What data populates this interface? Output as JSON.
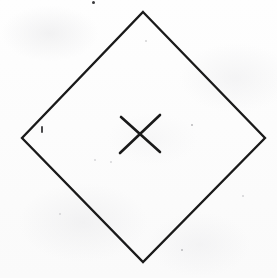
{
  "image": {
    "title": "Hand-drawn diamond with X mark",
    "description": "A scanned line drawing on off-white paper showing a large rhombus (diamond) outline with a small X mark near its center.",
    "width": 277,
    "height": 278,
    "background_color": "#fdfdfd",
    "ink_color": "#1a1a1a"
  },
  "shapes": {
    "diamond": {
      "name": "diamond-outline",
      "stroke_color": "#1a1a1a",
      "stroke_width": 2.3,
      "vertices": {
        "top": [
          143,
          12
        ],
        "right": [
          265,
          138
        ],
        "bottom": [
          143,
          262
        ],
        "left": [
          22,
          138
        ]
      },
      "points": "143,12 265,138 143,262 22,138"
    },
    "x_mark": {
      "name": "x-mark",
      "stroke_color": "#1a1a1a",
      "stroke_width": 2.6,
      "center": [
        139,
        134
      ],
      "stroke_1": {
        "from": [
          121,
          117
        ],
        "to": [
          160,
          152
        ]
      },
      "stroke_2": {
        "from": [
          160,
          115
        ],
        "to": [
          120,
          153
        ]
      }
    }
  },
  "artifacts": {
    "specks": [
      {
        "x": 93,
        "y": 2,
        "size": 3.0,
        "tone": "dark"
      },
      {
        "x": 192,
        "y": 125,
        "size": 2.2,
        "tone": "normal"
      },
      {
        "x": 95,
        "y": 160,
        "size": 2.0,
        "tone": "faint"
      },
      {
        "x": 111,
        "y": 162,
        "size": 1.8,
        "tone": "faint"
      },
      {
        "x": 182,
        "y": 250,
        "size": 2.4,
        "tone": "normal"
      },
      {
        "x": 146,
        "y": 41,
        "size": 1.6,
        "tone": "faint"
      },
      {
        "x": 243,
        "y": 196,
        "size": 1.5,
        "tone": "faint"
      },
      {
        "x": 60,
        "y": 214,
        "size": 1.5,
        "tone": "faint"
      }
    ],
    "tick": {
      "x": 41,
      "y": 126,
      "width": 1.6,
      "height": 6.5
    }
  }
}
